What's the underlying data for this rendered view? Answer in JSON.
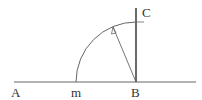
{
  "diagram": {
    "title": "",
    "labels": {
      "A": "A",
      "m": "m",
      "B": "B",
      "C": "C"
    },
    "colors": {
      "stroke": "#555555",
      "text": "#333333",
      "background": "#ffffff"
    }
  }
}
